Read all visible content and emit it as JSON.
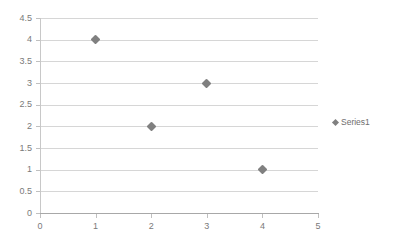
{
  "chart_data": {
    "type": "scatter",
    "title": "",
    "subtitle": "",
    "xlabel": "",
    "ylabel": "",
    "xlim": [
      0,
      5
    ],
    "ylim": [
      0,
      4.5
    ],
    "grid": true,
    "grid_axis": "y",
    "legend_position": "right",
    "x_ticks": [
      "0",
      "1",
      "2",
      "3",
      "4",
      "5"
    ],
    "y_ticks": [
      "0",
      "0.5",
      "1",
      "1.5",
      "2",
      "2.5",
      "3",
      "3.5",
      "4",
      "4.5"
    ],
    "series": [
      {
        "name": "Series1",
        "marker": "diamond",
        "color": "#808080",
        "points": [
          {
            "x": 1,
            "y": 4
          },
          {
            "x": 2,
            "y": 2
          },
          {
            "x": 3,
            "y": 3
          },
          {
            "x": 4,
            "y": 1
          }
        ]
      }
    ]
  },
  "legend": {
    "entries": [
      {
        "label": "Series1",
        "color": "#808080"
      }
    ]
  },
  "colors": {
    "marker": "#808080",
    "gridline": "#d6d6d6",
    "axis": "#a8a8a8",
    "tick_text": "#7a7a7a",
    "background": "#ffffff"
  }
}
